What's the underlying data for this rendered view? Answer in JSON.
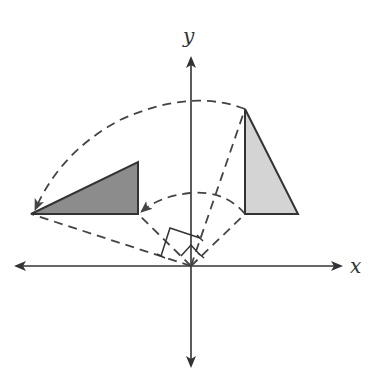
{
  "diagram": {
    "axes": {
      "x_label": "x",
      "y_label": "y",
      "origin": [
        191,
        266
      ]
    },
    "colors": {
      "line": "#333333",
      "preimage_fill": "#d4d4d4",
      "image_fill": "#8c8c8c",
      "dashed": "#444444"
    },
    "preimage_triangle": {
      "label": "original triangle",
      "points": [
        [
          245,
          109
        ],
        [
          245,
          214
        ],
        [
          298,
          214
        ]
      ]
    },
    "image_triangle": {
      "label": "rotated triangle",
      "points": [
        [
          31,
          214
        ],
        [
          138,
          214
        ],
        [
          138,
          162
        ]
      ]
    },
    "rotation_arcs": [
      {
        "from": [
          245,
          109
        ],
        "to": [
          31,
          214
        ],
        "label": "outer rotation arc"
      },
      {
        "from": [
          245,
          214
        ],
        "to": [
          138,
          214
        ],
        "label": "inner rotation arc"
      }
    ],
    "right_angle_markers": 2
  }
}
